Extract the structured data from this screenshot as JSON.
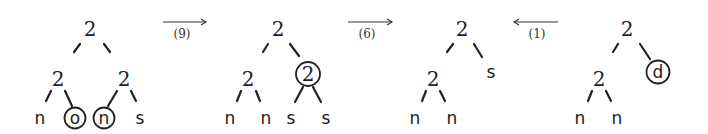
{
  "diagram": {
    "type": "tree-transformation-sequence",
    "trees": [
      {
        "id": "tree-1",
        "root": "2",
        "nodes": [
          {
            "label": "2",
            "x": 90,
            "y": 30,
            "kind": "internal"
          },
          {
            "label": "2",
            "x": 58,
            "y": 80,
            "kind": "internal"
          },
          {
            "label": "2",
            "x": 124,
            "y": 80,
            "kind": "internal"
          },
          {
            "label": "n",
            "x": 40,
            "y": 124,
            "kind": "leaf",
            "circled": false
          },
          {
            "label": "o",
            "x": 75,
            "y": 124,
            "kind": "leaf",
            "circled": true
          },
          {
            "label": "n",
            "x": 104,
            "y": 124,
            "kind": "leaf",
            "circled": true
          },
          {
            "label": "s",
            "x": 140,
            "y": 124,
            "kind": "leaf",
            "circled": false
          }
        ]
      },
      {
        "id": "tree-2",
        "root": "2",
        "nodes": [
          {
            "label": "2",
            "x": 278,
            "y": 30,
            "kind": "internal"
          },
          {
            "label": "2",
            "x": 248,
            "y": 80,
            "kind": "internal"
          },
          {
            "label": "2",
            "x": 308,
            "y": 80,
            "kind": "internal",
            "circled": true
          },
          {
            "label": "n",
            "x": 230,
            "y": 124,
            "kind": "leaf"
          },
          {
            "label": "n",
            "x": 266,
            "y": 124,
            "kind": "leaf"
          },
          {
            "label": "s",
            "x": 290,
            "y": 124,
            "kind": "leaf"
          },
          {
            "label": "s",
            "x": 326,
            "y": 124,
            "kind": "leaf"
          }
        ]
      },
      {
        "id": "tree-3",
        "root": "2",
        "nodes": [
          {
            "label": "2",
            "x": 462,
            "y": 30,
            "kind": "internal"
          },
          {
            "label": "2",
            "x": 433,
            "y": 80,
            "kind": "internal"
          },
          {
            "label": "s",
            "x": 491,
            "y": 78,
            "kind": "leaf"
          },
          {
            "label": "n",
            "x": 415,
            "y": 124,
            "kind": "leaf"
          },
          {
            "label": "n",
            "x": 452,
            "y": 124,
            "kind": "leaf"
          }
        ]
      },
      {
        "id": "tree-4",
        "root": "2",
        "nodes": [
          {
            "label": "2",
            "x": 627,
            "y": 30,
            "kind": "internal"
          },
          {
            "label": "2",
            "x": 599,
            "y": 80,
            "kind": "internal"
          },
          {
            "label": "d",
            "x": 658,
            "y": 78,
            "kind": "leaf",
            "circled": true
          },
          {
            "label": "n",
            "x": 580,
            "y": 124,
            "kind": "leaf"
          },
          {
            "label": "n",
            "x": 617,
            "y": 124,
            "kind": "leaf"
          }
        ]
      }
    ],
    "arrows": [
      {
        "direction": "right",
        "label": "(9)",
        "from": "tree-1",
        "to": "tree-2"
      },
      {
        "direction": "right",
        "label": "(6)",
        "from": "tree-2",
        "to": "tree-3"
      },
      {
        "direction": "left",
        "label": "(1)",
        "from": "tree-4",
        "to": "tree-3"
      }
    ]
  }
}
